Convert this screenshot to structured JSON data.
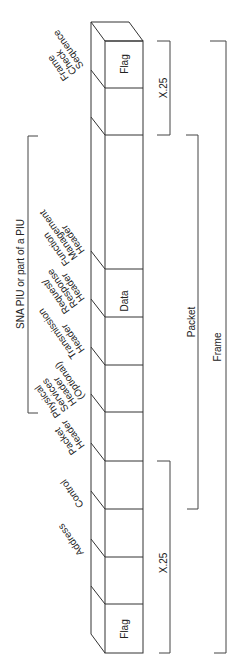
{
  "diagram": {
    "type": "frame-structure",
    "fields": [
      {
        "id": "flag_end",
        "label": "Flag",
        "inside": true
      },
      {
        "id": "fcs",
        "label": "Frame Check Sequence",
        "inside": false
      },
      {
        "id": "data",
        "label": "Data",
        "inside": true
      },
      {
        "id": "fm_header",
        "label": "Function Management Header",
        "inside": false
      },
      {
        "id": "rh",
        "label": "Request/ Response Header",
        "inside": false
      },
      {
        "id": "th",
        "label": "Transmission Header",
        "inside": false
      },
      {
        "id": "psh",
        "label": "Physical Services Header (Optional)",
        "inside": false
      },
      {
        "id": "packet_header",
        "label": "Packet Header",
        "inside": false
      },
      {
        "id": "control",
        "label": "Control",
        "inside": false
      },
      {
        "id": "address",
        "label": "Address",
        "inside": false
      },
      {
        "id": "flag_start",
        "label": "Flag",
        "inside": true
      }
    ],
    "labels": {
      "flag_top": "Flag",
      "flag_bottom": "Flag",
      "data": "Data",
      "fcs": [
        "Frame",
        "Check",
        "Sequence"
      ],
      "fmh": [
        "Function",
        "Management",
        "Header"
      ],
      "rh": [
        "Request/",
        "Response",
        "Header"
      ],
      "th": [
        "Transmission",
        "Header"
      ],
      "psh": [
        "Physical",
        "Services",
        "Header",
        "(Optional)"
      ],
      "ph": [
        "Packet",
        "Header"
      ],
      "control": "Control",
      "address": "Address"
    },
    "brackets": {
      "sna": "SNA PIU or part of a PIU",
      "x25_top": "X.25",
      "x25_bottom": "X.25",
      "packet": "Packet",
      "frame": "Frame"
    }
  }
}
